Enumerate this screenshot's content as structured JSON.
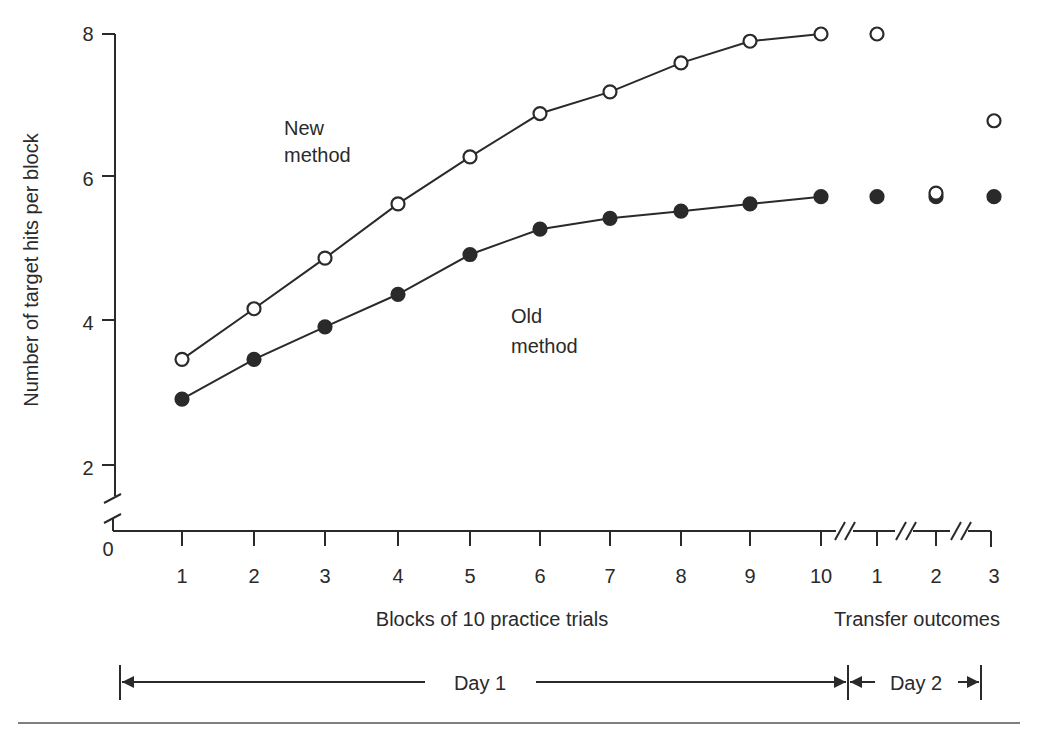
{
  "chart_data": {
    "type": "line",
    "title": "",
    "ylabel": "Number of target hits per block",
    "xlabel": "Blocks of 10 practice trials",
    "xlabel_transfer": "Transfer outcomes",
    "ylim": [
      0,
      8
    ],
    "yticks": [
      "2",
      "4",
      "6",
      "8"
    ],
    "y_origin_label": "0",
    "xticks_practice": [
      "1",
      "2",
      "3",
      "4",
      "5",
      "6",
      "7",
      "8",
      "9",
      "10"
    ],
    "xticks_transfer": [
      "1",
      "2",
      "3"
    ],
    "grid": false,
    "series": [
      {
        "name": "New method",
        "marker": "open-circle",
        "practice": [
          3.5,
          4.2,
          4.9,
          5.65,
          6.3,
          6.9,
          7.2,
          7.6,
          7.9,
          8.0
        ],
        "transfer": [
          8.0,
          5.8,
          6.8
        ]
      },
      {
        "name": "Old method",
        "marker": "filled-circle",
        "practice": [
          2.95,
          3.5,
          3.95,
          4.4,
          4.95,
          5.3,
          5.45,
          5.55,
          5.65,
          5.75
        ],
        "transfer": [
          5.75,
          5.75,
          5.75
        ]
      }
    ],
    "annotations": [
      {
        "label_line1": "New",
        "label_line2": "method"
      },
      {
        "label_line1": "Old",
        "label_line2": "method"
      }
    ],
    "day_spans": [
      {
        "label": "Day 1"
      },
      {
        "label": "Day 2"
      }
    ]
  }
}
